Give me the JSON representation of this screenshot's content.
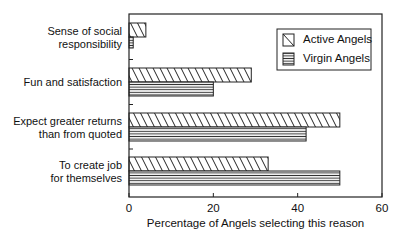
{
  "chart_data": {
    "type": "bar",
    "orientation": "horizontal",
    "title": "",
    "xlabel": "Percentage of Angels selecting this reason",
    "ylabel": "",
    "xlim": [
      0,
      60
    ],
    "xticks": [
      0,
      20,
      40,
      60
    ],
    "grid": false,
    "legend_position": "upper right",
    "categories": [
      "Sense of social responsibility",
      "Fun and satisfaction",
      "Expect greater returns than from quoted",
      "To create job for themselves"
    ],
    "category_lines": [
      [
        "Sense of social",
        "responsibility"
      ],
      [
        "Fun and satisfaction"
      ],
      [
        "Expect greater returns",
        "than from quoted"
      ],
      [
        "To create job",
        "for themselves"
      ]
    ],
    "series": [
      {
        "name": "Active Angels",
        "pattern": "diagonal-hatch",
        "values": [
          4,
          29,
          50,
          33
        ]
      },
      {
        "name": "Virgin Angels",
        "pattern": "horizontal-lines",
        "values": [
          1,
          20,
          42,
          50
        ]
      }
    ]
  }
}
